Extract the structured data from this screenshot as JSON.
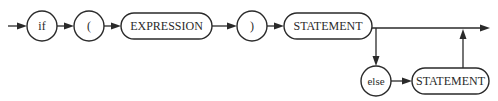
{
  "diagram": {
    "colors": {
      "stroke": "#2a2a2a",
      "fill": "#ffffff",
      "background": "#ffffff"
    },
    "nodes": [
      {
        "id": "if",
        "kind": "terminal",
        "label": "if"
      },
      {
        "id": "lparen",
        "kind": "terminal",
        "label": "("
      },
      {
        "id": "expression",
        "kind": "nonterminal",
        "label": "EXPRESSION"
      },
      {
        "id": "rparen",
        "kind": "terminal",
        "label": ")"
      },
      {
        "id": "statement",
        "kind": "nonterminal",
        "label": "STATEMENT"
      },
      {
        "id": "else",
        "kind": "terminal",
        "label": "else"
      },
      {
        "id": "else_statement",
        "kind": "nonterminal",
        "label": "STATEMENT"
      }
    ],
    "edges": [
      {
        "from": "entry",
        "to": "if"
      },
      {
        "from": "if",
        "to": "lparen"
      },
      {
        "from": "lparen",
        "to": "expression"
      },
      {
        "from": "expression",
        "to": "rparen"
      },
      {
        "from": "rparen",
        "to": "statement"
      },
      {
        "from": "statement",
        "to": "exit"
      },
      {
        "from": "statement",
        "to": "else"
      },
      {
        "from": "else",
        "to": "else_statement"
      },
      {
        "from": "else_statement",
        "to": "exit"
      }
    ]
  }
}
